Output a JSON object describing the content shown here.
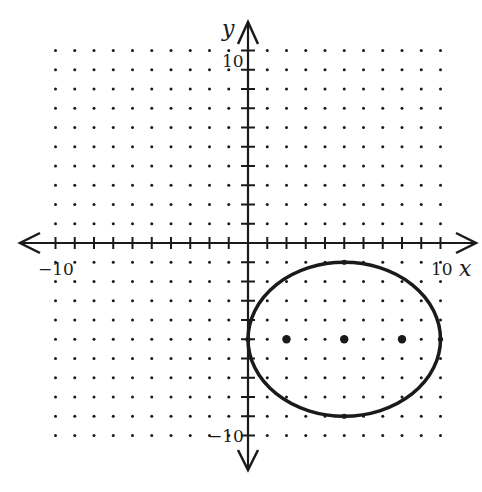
{
  "chart_data": {
    "type": "scatter",
    "title": "",
    "xlabel": "x",
    "ylabel": "y",
    "xlim": [
      -10,
      10
    ],
    "ylim": [
      -10,
      10
    ],
    "grid": "dotted lattice at integer points",
    "x_tick_labels": [
      {
        "value": -10,
        "label": "-10"
      },
      {
        "value": 10,
        "label": "10"
      }
    ],
    "y_tick_labels": [
      {
        "value": 10,
        "label": "10"
      },
      {
        "value": -10,
        "label": "-10"
      }
    ],
    "curves": [
      {
        "type": "ellipse",
        "center": [
          5,
          -5
        ],
        "semi_axis_x": 5,
        "semi_axis_y": 4,
        "equation": "(x-5)^2/25 + (y+5)^2/16 = 1"
      }
    ],
    "points": [
      {
        "name": "focus-left",
        "x": 2,
        "y": -5
      },
      {
        "name": "center",
        "x": 5,
        "y": -5
      },
      {
        "name": "focus-right",
        "x": 8,
        "y": -5
      }
    ],
    "vertices": [
      [
        0,
        -5
      ],
      [
        10,
        -5
      ],
      [
        5,
        -1
      ],
      [
        5,
        -9
      ]
    ]
  },
  "labels": {
    "x_axis": "x",
    "y_axis": "y",
    "x_min": "−10",
    "x_max": "10",
    "y_max": "10",
    "y_min": "−10"
  },
  "colors": {
    "ink": "#1a1a1a",
    "background": "#ffffff"
  }
}
